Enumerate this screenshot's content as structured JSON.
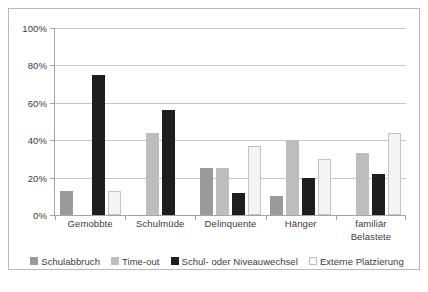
{
  "chart_data": {
    "type": "bar",
    "title": "",
    "xlabel": "",
    "ylabel": "",
    "ylim": [
      0,
      100
    ],
    "grid": true,
    "legend_position": "bottom",
    "categories": [
      "Gemobbte",
      "Schulmüde",
      "Delinquente",
      "Hänger",
      "familiär Belastete"
    ],
    "y_ticks": [
      "0%",
      "20%",
      "40%",
      "60%",
      "80%",
      "100%"
    ],
    "y_tick_values": [
      0,
      20,
      40,
      60,
      80,
      100
    ],
    "series": [
      {
        "name": "Schulabbruch",
        "color": "#9a9a9a",
        "values": [
          13,
          0,
          25,
          10,
          0
        ]
      },
      {
        "name": "Time-out",
        "color": "#bdbdbd",
        "values": [
          0,
          44,
          25,
          40,
          33
        ]
      },
      {
        "name": "Schul- oder Niveauwechsel",
        "color": "#1e1e1e",
        "values": [
          75,
          56,
          12,
          20,
          22
        ]
      },
      {
        "name": "Externe Platzierung",
        "color": "#f4f4f4",
        "values": [
          13,
          0,
          37,
          30,
          44
        ]
      }
    ]
  },
  "axis": {
    "y_labels": [
      "100%",
      "80%",
      "60%",
      "40%",
      "20%",
      "0%"
    ]
  },
  "categories": [
    {
      "line1": "Gemobbte",
      "line2": ""
    },
    {
      "line1": "Schulmüde",
      "line2": ""
    },
    {
      "line1": "Delinquente",
      "line2": ""
    },
    {
      "line1": "Hänger",
      "line2": ""
    },
    {
      "line1": "familiär",
      "line2": "Belastete"
    }
  ],
  "legend": {
    "items": [
      {
        "label": "Schulabbruch"
      },
      {
        "label": "Time-out"
      },
      {
        "label": "Schul- oder Niveauwechsel"
      },
      {
        "label": "Externe Platzierung"
      }
    ]
  },
  "caption": ""
}
